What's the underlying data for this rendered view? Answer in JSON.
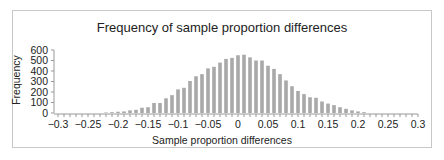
{
  "chart_data": {
    "type": "bar",
    "title": "Frequency of sample proportion differences",
    "xlabel": "Sample proportion differences",
    "ylabel": "Frequency",
    "xlim": [
      -0.3,
      0.3
    ],
    "ylim": [
      0,
      600
    ],
    "xticks": [
      "-0.3",
      "-0.25",
      "-0.2",
      "-0.15",
      "-0.1",
      "-0.05",
      "0",
      "0.05",
      "0.1",
      "0.15",
      "0.2",
      "0.25",
      "0.3"
    ],
    "yticks": [
      "0",
      "100",
      "200",
      "300",
      "400",
      "500",
      "600"
    ],
    "grid": false,
    "bar_color": "#a9a9a9",
    "x": [
      -0.22,
      -0.21,
      -0.2,
      -0.19,
      -0.18,
      -0.17,
      -0.16,
      -0.15,
      -0.14,
      -0.13,
      -0.12,
      -0.11,
      -0.1,
      -0.09,
      -0.08,
      -0.07,
      -0.06,
      -0.05,
      -0.04,
      -0.03,
      -0.02,
      -0.01,
      0,
      0.01,
      0.02,
      0.03,
      0.04,
      0.05,
      0.06,
      0.07,
      0.08,
      0.09,
      0.1,
      0.11,
      0.12,
      0.13,
      0.14,
      0.15,
      0.16,
      0.17,
      0.18,
      0.19,
      0.2,
      0.21
    ],
    "values": [
      5,
      8,
      12,
      15,
      25,
      30,
      50,
      55,
      95,
      95,
      140,
      170,
      225,
      240,
      305,
      350,
      370,
      425,
      440,
      480,
      515,
      525,
      550,
      555,
      530,
      500,
      500,
      450,
      420,
      370,
      310,
      255,
      210,
      180,
      150,
      145,
      110,
      90,
      75,
      55,
      40,
      25,
      15,
      8
    ]
  },
  "labels": {
    "title": "Frequency of sample proportion differences",
    "xlabel": "Sample proportion differences",
    "ylabel": "Frequency"
  }
}
